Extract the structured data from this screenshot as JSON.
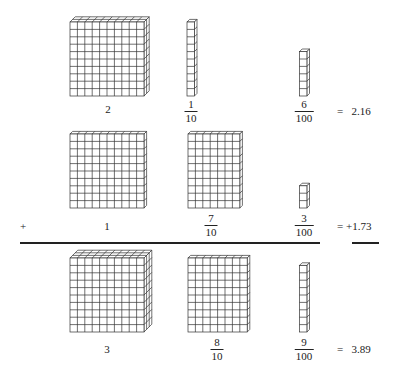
{
  "figure": {
    "rows": [
      {
        "id": "addend1",
        "prefix": "",
        "ones": {
          "label": "2",
          "layers": 2
        },
        "tenths": {
          "num": "1",
          "den": "10",
          "rods": 1
        },
        "hundredths": {
          "num": "6",
          "den": "100",
          "cubes": 6
        },
        "result": "=   2.16"
      },
      {
        "id": "addend2",
        "prefix": "+",
        "ones": {
          "label": "1",
          "layers": 1
        },
        "tenths": {
          "num": "7",
          "den": "10",
          "rods": 7
        },
        "hundredths": {
          "num": "3",
          "den": "100",
          "cubes": 3
        },
        "result": "= +1.73"
      },
      {
        "id": "sum",
        "prefix": "",
        "ones": {
          "label": "3",
          "layers": 3
        },
        "tenths": {
          "num": "8",
          "den": "10",
          "rods": 8
        },
        "hundredths": {
          "num": "9",
          "den": "100",
          "cubes": 9
        },
        "result": "=   3.89"
      }
    ],
    "colors": {
      "line": "#333333",
      "face": "#ffffff",
      "background": "#ffffff"
    }
  }
}
